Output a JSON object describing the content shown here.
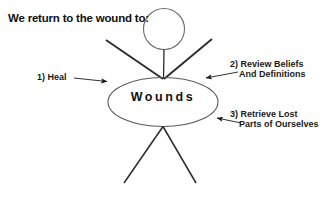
{
  "diagram": {
    "title": "We return to the wound to:",
    "center_label": "Wounds",
    "callouts": [
      {
        "id": "heal",
        "line1": "1) Heal",
        "line2": ""
      },
      {
        "id": "review-beliefs",
        "line1": "2) Review Beliefs",
        "line2": "And Definitions"
      },
      {
        "id": "retrieve-lost-parts",
        "line1": "3) Retrieve Lost",
        "line2": "Parts of Ourselves"
      }
    ],
    "figure": {
      "head": "stick-figure-head-circle",
      "body": "stick-figure-torso-line",
      "arms": "stick-figure-arms",
      "legs": "stick-figure-legs",
      "center_shape": "wounds-ellipse"
    },
    "colors": {
      "ink": "#1a1a1a",
      "outline": "#555555",
      "background": "#ffffff"
    }
  }
}
